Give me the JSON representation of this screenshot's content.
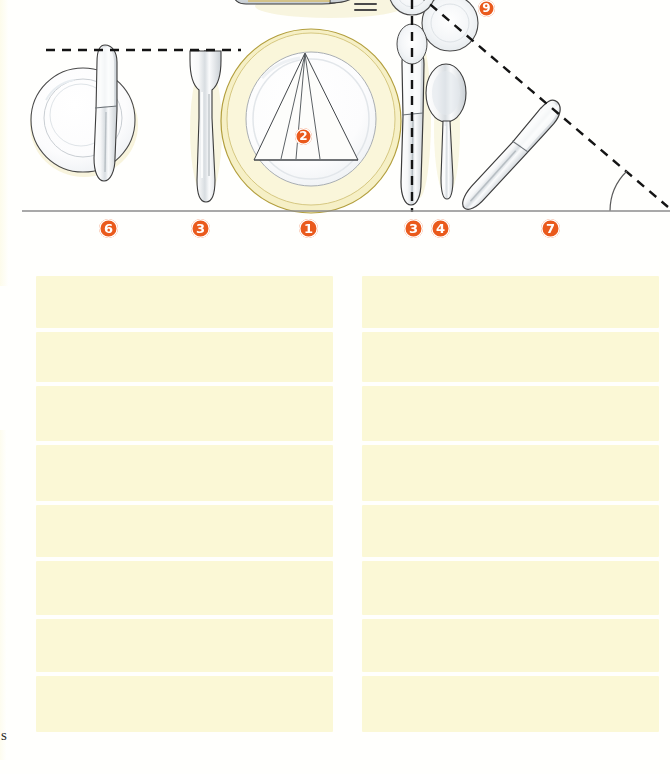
{
  "page": {
    "type": "scanned-book-illustration",
    "background_color": "#ffffff",
    "width": 670,
    "height": 774
  },
  "illustration": {
    "name": "formal-place-setting-diagram",
    "description": "Overhead line drawing of a formal table place setting with numbered callouts",
    "table_edge_line_y": 211,
    "colors": {
      "badge_fill": "#ea5a1c",
      "badge_text": "#ffffff",
      "plate_rim": "#f4edbf",
      "plate_rim_stroke": "#b9a33f",
      "outline": "#3c3c3c",
      "shadow": "#efe6b5",
      "dashed_guide": "#1c1c1c"
    },
    "items": [
      {
        "id": "service-plate",
        "number": "1",
        "label_x": 304,
        "label_y": 228
      },
      {
        "id": "napkin",
        "number": "2",
        "label_x": 304,
        "label_y": 130
      },
      {
        "id": "dinner-fork",
        "number": "3",
        "label_x": 200,
        "label_y": 228
      },
      {
        "id": "dinner-knife",
        "number": "3",
        "label_x": 413,
        "label_y": 228
      },
      {
        "id": "soup-spoon",
        "number": "4",
        "label_x": 440,
        "label_y": 228
      },
      {
        "id": "bread-plate",
        "number": "6",
        "label_x": 108,
        "label_y": 228
      },
      {
        "id": "butter-knife",
        "number": "7",
        "label_x": 550,
        "label_y": 228
      },
      {
        "id": "water-glass",
        "number": "9",
        "label_x": 487,
        "label_y": 8
      }
    ],
    "callout_numbers_bottom": [
      "6",
      "3",
      "1",
      "3",
      "4",
      "7"
    ],
    "callout_number_napkin": "2",
    "callout_number_glass": "9",
    "guides": {
      "horizontal_dashed": {
        "x1": 46,
        "x2": 241,
        "y": 50
      },
      "vertical_dashed": {
        "x": 412,
        "y1": 0,
        "y2": 212
      },
      "diagonal_dashed": {
        "x1": 420,
        "y1": 0,
        "x2": 666,
        "y2": 208
      },
      "angle_arc": {
        "cx": 666,
        "cy": 211,
        "r": 56
      }
    }
  },
  "body_text": {
    "note": "Two columns of highlighted (redacted) body-text lines",
    "highlight_color": "#fbf8d6",
    "columns": [
      {
        "name": "left-column",
        "x": 36,
        "width": 297,
        "lines": [
          {
            "height": 52,
            "top": 16
          },
          {
            "height": 50,
            "top": 72
          },
          {
            "height": 55,
            "top": 126
          },
          {
            "height": 56,
            "top": 185
          },
          {
            "height": 52,
            "top": 245
          },
          {
            "height": 54,
            "top": 301
          },
          {
            "height": 53,
            "top": 359
          },
          {
            "height": 56,
            "top": 416
          }
        ]
      },
      {
        "name": "right-column",
        "x": 362,
        "width": 297,
        "lines": [
          {
            "height": 52,
            "top": 16
          },
          {
            "height": 50,
            "top": 72
          },
          {
            "height": 55,
            "top": 126
          },
          {
            "height": 56,
            "top": 185
          },
          {
            "height": 52,
            "top": 245
          },
          {
            "height": 54,
            "top": 301
          },
          {
            "height": 53,
            "top": 359
          },
          {
            "height": 56,
            "top": 416
          }
        ]
      }
    ],
    "orphan_character": "s"
  }
}
